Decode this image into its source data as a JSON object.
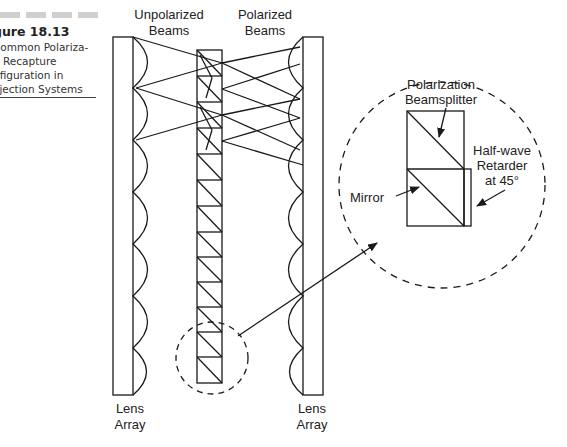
{
  "caption": {
    "title": "gure 18.13",
    "lines": [
      "Common Polariza-",
      "n Recapture",
      "nfiguration in",
      "ojection Systems"
    ]
  },
  "labels": {
    "unpolarized_1": "Unpolarized",
    "unpolarized_2": "Beams",
    "polarized_1": "Polarized",
    "polarized_2": "Beams",
    "lens_left_1": "Lens",
    "lens_left_2": "Array",
    "lens_right_1": "Lens",
    "lens_right_2": "Array",
    "pbs_1": "Polarization",
    "pbs_2": "Beamsplitter",
    "retarder_1": "Half-wave",
    "retarder_2": "Retarder",
    "retarder_3": "at 45°",
    "mirror": "Mirror"
  },
  "colors": {
    "line": "#1a1a1a",
    "background": "#ffffff"
  }
}
